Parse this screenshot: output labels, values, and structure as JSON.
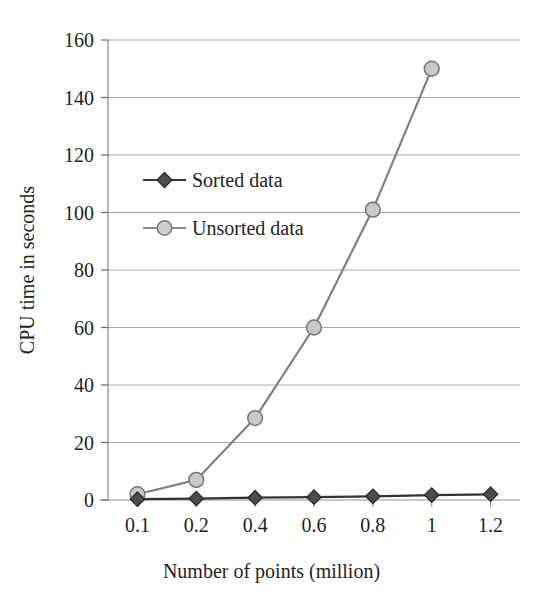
{
  "chart_data": {
    "type": "line",
    "title": "",
    "xlabel": "Number of points (million)",
    "ylabel": "CPU time in seconds",
    "categories": [
      "0.1",
      "0.2",
      "0.4",
      "0.6",
      "0.8",
      "1",
      "1.2"
    ],
    "x_tick_labels": [
      "0.1",
      "0.2",
      "0.4",
      "0.6",
      "0.8",
      "1",
      "1.2"
    ],
    "y_tick_labels": [
      "0",
      "20",
      "40",
      "60",
      "80",
      "100",
      "120",
      "140",
      "160"
    ],
    "y_ticks": [
      0,
      20,
      40,
      60,
      80,
      100,
      120,
      140,
      160
    ],
    "ylim": [
      0,
      160
    ],
    "grid": "horizontal",
    "legend_position": "upper-left-inside",
    "series": [
      {
        "name": "Sorted data",
        "marker": "diamond",
        "color": "#4d4d4d",
        "line_color": "#333333",
        "values": [
          0.3,
          0.5,
          0.8,
          1.0,
          1.3,
          1.7,
          2.0
        ]
      },
      {
        "name": "Unsorted data",
        "marker": "circle",
        "color": "#c9c9c9",
        "line_color": "#808080",
        "values": [
          2,
          7,
          28.5,
          60,
          101,
          150,
          null
        ]
      }
    ]
  },
  "axes": {
    "y_label": "CPU time in seconds",
    "x_label": "Number of points (million)"
  },
  "legend": {
    "entries": [
      {
        "label": "Sorted data"
      },
      {
        "label": "Unsorted data"
      }
    ]
  }
}
